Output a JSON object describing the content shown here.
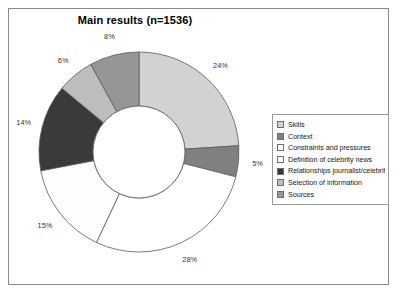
{
  "chart_data": {
    "type": "pie",
    "variant": "donut",
    "title": "Main results (n=1536)",
    "xlabel": "",
    "ylabel": "",
    "grid": false,
    "legend_position": "right",
    "value_unit": "%",
    "total_label": "n=1536",
    "categories": [
      "Skills",
      "Context",
      "Constraints and pressures",
      "Definition of celebrity news",
      "Relationships journalist/celebrity",
      "Selection of information",
      "Sources"
    ],
    "values": [
      24,
      5,
      28,
      15,
      14,
      6,
      8
    ],
    "labels": [
      "24%",
      "5%",
      "28%",
      "15%",
      "14%",
      "6%",
      "8%"
    ],
    "colors": [
      "#d2d2d2",
      "#808080",
      "#ffffff",
      "#fdfdfd",
      "#3a3a3a",
      "#bdbdbd",
      "#969696"
    ],
    "slice_border_color": "#5a5a5a",
    "start_angle_deg": 0,
    "direction": "clockwise",
    "inner_radius_ratio": 0.46
  },
  "figure": {
    "background": "#ffffff",
    "frame_border_color": "#8a8a8a"
  },
  "legend": {
    "items": [
      {
        "label": "Skills",
        "color": "#d2d2d2"
      },
      {
        "label": "Context",
        "color": "#808080"
      },
      {
        "label": "Constraints and pressures",
        "color": "#ffffff"
      },
      {
        "label": "Definition of celebrity news",
        "color": "#fdfdfd"
      },
      {
        "label": "Relationships journalist/celebrity",
        "color": "#3a3a3a"
      },
      {
        "label": "Selection of information",
        "color": "#bdbdbd"
      },
      {
        "label": "Sources",
        "color": "#969696"
      }
    ]
  }
}
